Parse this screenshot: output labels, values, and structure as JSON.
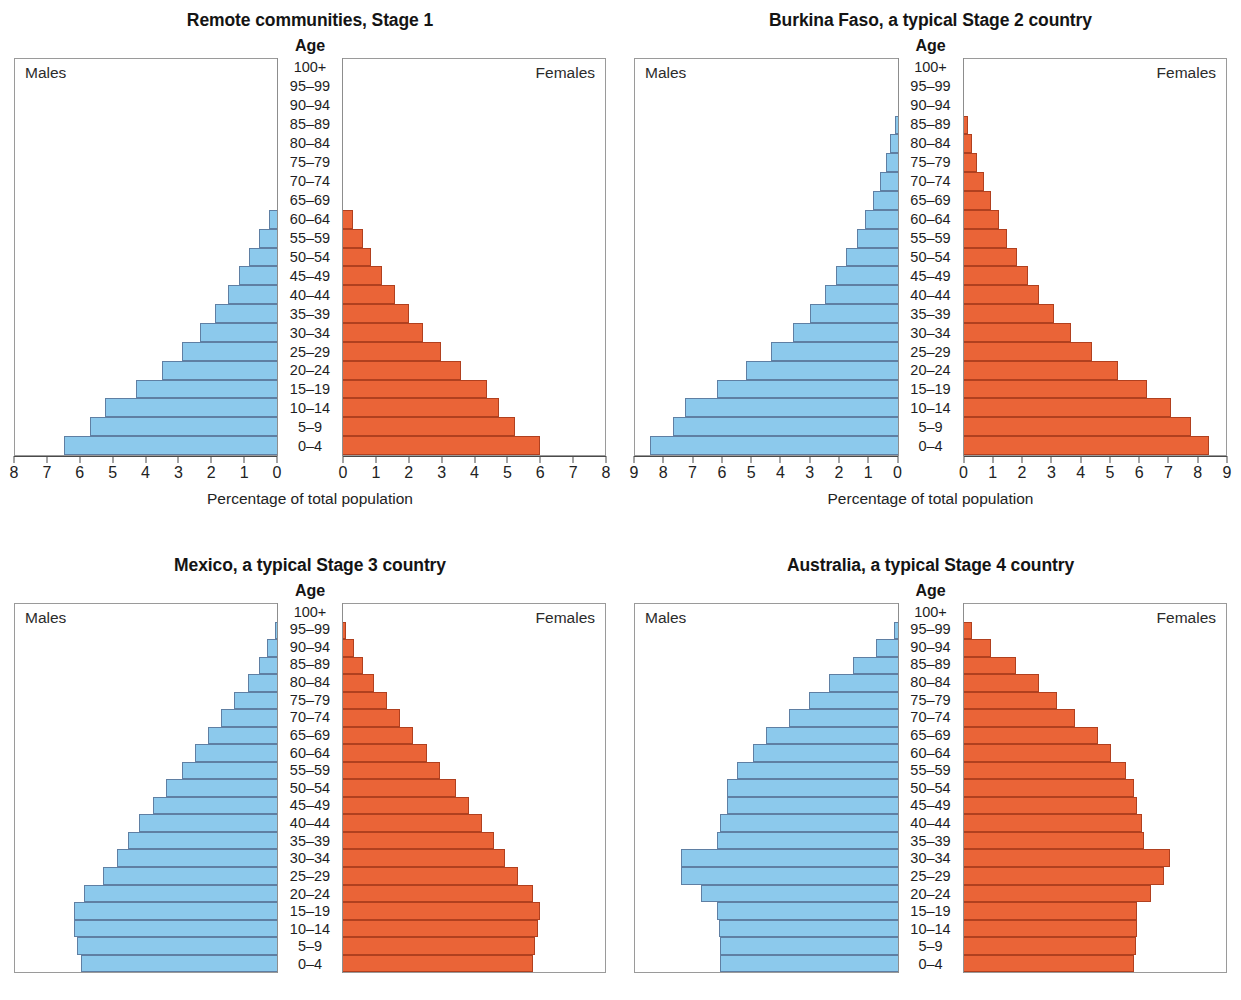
{
  "figure": {
    "axis_caption": "Percentage of total population",
    "age_heading": "Age",
    "males_label": "Males",
    "females_label": "Females",
    "male_color": "#8CC9EC",
    "female_color": "#EA6437",
    "age_groups": [
      "100+",
      "95–99",
      "90–94",
      "85–89",
      "80–84",
      "75–79",
      "70–74",
      "65–69",
      "60–64",
      "55–59",
      "50–54",
      "45–49",
      "40–44",
      "35–39",
      "30–34",
      "25–29",
      "20–24",
      "15–19",
      "10–14",
      "5–9",
      "0–4"
    ]
  },
  "chart_data": [
    {
      "type": "bar",
      "id": "remote-communities",
      "title": "Remote communities, Stage 1",
      "xlabel": "Percentage of total population",
      "ylabel": "Age",
      "categories": [
        "100+",
        "95–99",
        "90–94",
        "85–89",
        "80–84",
        "75–79",
        "70–74",
        "65–69",
        "60–64",
        "55–59",
        "50–54",
        "45–49",
        "40–44",
        "35–39",
        "30–34",
        "25–29",
        "20–24",
        "15–19",
        "10–14",
        "5–9",
        "0–4"
      ],
      "xlim": [
        0,
        8
      ],
      "xticks": [
        0,
        1,
        2,
        3,
        4,
        5,
        6,
        7,
        8
      ],
      "xticks_left_labels": [
        "8",
        "7",
        "6",
        "5",
        "4",
        "3",
        "2",
        "1",
        "0"
      ],
      "xticks_right_labels": [
        "0",
        "1",
        "2",
        "3",
        "4",
        "5",
        "6",
        "7",
        "8"
      ],
      "series": [
        {
          "name": "Males",
          "values": [
            0,
            0,
            0,
            0,
            0,
            0,
            0,
            0,
            0.25,
            0.55,
            0.85,
            1.15,
            1.5,
            1.9,
            2.35,
            2.9,
            3.5,
            4.3,
            5.25,
            5.7,
            6.5
          ]
        },
        {
          "name": "Females",
          "values": [
            0,
            0,
            0,
            0,
            0,
            0,
            0,
            0,
            0.3,
            0.6,
            0.85,
            1.2,
            1.6,
            2.0,
            2.45,
            3.0,
            3.6,
            4.4,
            4.75,
            5.25,
            6.0
          ]
        }
      ]
    },
    {
      "type": "bar",
      "id": "burkina-faso",
      "title": "Burkina Faso, a typical Stage 2 country",
      "xlabel": "Percentage of total population",
      "ylabel": "Age",
      "categories": [
        "100+",
        "95–99",
        "90–94",
        "85–89",
        "80–84",
        "75–79",
        "70–74",
        "65–69",
        "60–64",
        "55–59",
        "50–54",
        "45–49",
        "40–44",
        "35–39",
        "30–34",
        "25–29",
        "20–24",
        "15–19",
        "10–14",
        "5–9",
        "0–4"
      ],
      "xlim": [
        0,
        9
      ],
      "xticks": [
        0,
        1,
        2,
        3,
        4,
        5,
        6,
        7,
        8,
        9
      ],
      "xticks_left_labels": [
        "9",
        "8",
        "7",
        "6",
        "5",
        "4",
        "3",
        "2",
        "1",
        "0"
      ],
      "xticks_right_labels": [
        "0",
        "1",
        "2",
        "3",
        "4",
        "5",
        "6",
        "7",
        "8",
        "9"
      ],
      "series": [
        {
          "name": "Males",
          "values": [
            0,
            0,
            0,
            0.1,
            0.25,
            0.4,
            0.6,
            0.85,
            1.1,
            1.4,
            1.75,
            2.1,
            2.5,
            3.0,
            3.6,
            4.35,
            5.2,
            6.2,
            7.3,
            7.7,
            8.5
          ]
        },
        {
          "name": "Females",
          "values": [
            0,
            0,
            0,
            0.15,
            0.3,
            0.45,
            0.7,
            0.95,
            1.2,
            1.5,
            1.85,
            2.2,
            2.6,
            3.1,
            3.7,
            4.4,
            5.3,
            6.3,
            7.1,
            7.8,
            8.4
          ]
        }
      ]
    },
    {
      "type": "bar",
      "id": "mexico",
      "title": "Mexico, a typical Stage 3 country",
      "xlabel": "Percentage of total population",
      "ylabel": "Age",
      "categories": [
        "100+",
        "95–99",
        "90–94",
        "85–89",
        "80–84",
        "75–79",
        "70–74",
        "65–69",
        "60–64",
        "55–59",
        "50–54",
        "45–49",
        "40–44",
        "35–39",
        "30–34",
        "25–29",
        "20–24",
        "15–19",
        "10–14",
        "5–9",
        "0–4"
      ],
      "xlim": [
        0,
        8
      ],
      "note_cropped": "bottom of panel cut off by image edge",
      "series": [
        {
          "name": "Males",
          "values": [
            0,
            0.05,
            0.3,
            0.55,
            0.9,
            1.3,
            1.7,
            2.1,
            2.5,
            2.9,
            3.4,
            3.8,
            4.2,
            4.55,
            4.9,
            5.3,
            5.9,
            6.2,
            6.2,
            6.1,
            6.0
          ]
        },
        {
          "name": "Females",
          "values": [
            0,
            0.1,
            0.35,
            0.6,
            0.95,
            1.35,
            1.75,
            2.15,
            2.55,
            2.95,
            3.45,
            3.85,
            4.25,
            4.6,
            4.95,
            5.35,
            5.8,
            6.0,
            5.95,
            5.85,
            5.8
          ]
        }
      ]
    },
    {
      "type": "bar",
      "id": "australia",
      "title": "Australia, a typical Stage 4 country",
      "xlabel": "Percentage of total population",
      "ylabel": "Age",
      "categories": [
        "100+",
        "95–99",
        "90–94",
        "85–89",
        "80–84",
        "75–79",
        "70–74",
        "65–69",
        "60–64",
        "55–59",
        "50–54",
        "45–49",
        "40–44",
        "35–39",
        "30–34",
        "25–29",
        "20–24",
        "15–19",
        "10–14",
        "5–9",
        "0–4"
      ],
      "xlim": [
        0,
        8
      ],
      "note_cropped": "bottom of panel cut off by image edge",
      "series": [
        {
          "name": "Males",
          "values": [
            0,
            0.1,
            0.65,
            1.35,
            2.1,
            2.7,
            3.3,
            4.0,
            4.4,
            4.9,
            5.2,
            5.2,
            5.4,
            5.5,
            6.6,
            6.6,
            6.0,
            5.5,
            5.45,
            5.4,
            5.4
          ]
        },
        {
          "name": "Females",
          "values": [
            0,
            0.25,
            0.85,
            1.6,
            2.3,
            2.85,
            3.4,
            4.1,
            4.5,
            4.95,
            5.2,
            5.3,
            5.45,
            5.5,
            6.3,
            6.1,
            5.7,
            5.3,
            5.3,
            5.25,
            5.2
          ]
        }
      ]
    }
  ]
}
